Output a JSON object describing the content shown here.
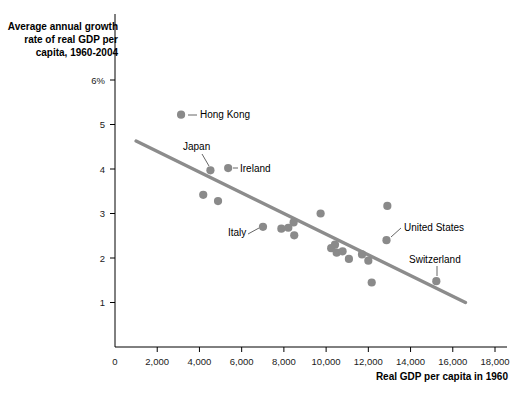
{
  "chart_data": {
    "type": "scatter",
    "title": "Average annual growth\nrate of real GDP per\ncapita, 1960-2004",
    "xlabel": "Real GDP per capita in 1960",
    "ylabel": "",
    "xlim": [
      0,
      18000
    ],
    "ylim": [
      0,
      6
    ],
    "grid": false,
    "legend": null,
    "x_ticks": [
      0,
      2000,
      4000,
      6000,
      8000,
      10000,
      12000,
      14000,
      16000,
      18000
    ],
    "x_tick_labels": [
      "0",
      "2,000",
      "4,000",
      "6,000",
      "8,000",
      "10,000",
      "12,000",
      "14,000",
      "16,000",
      "18,000"
    ],
    "y_ticks": [
      1,
      2,
      3,
      4,
      5,
      6
    ],
    "y_tick_labels": [
      "1",
      "2",
      "3",
      "4",
      "5",
      "6%"
    ],
    "point_color": "#8a8a8a",
    "trend_color": "#8c8c8c",
    "trendline": {
      "x0": 1000,
      "y0": 4.63,
      "x1": 16600,
      "y1": 1.0
    },
    "points": [
      {
        "x": 3130,
        "y": 5.22,
        "label": "Hong Kong"
      },
      {
        "x": 4520,
        "y": 3.97,
        "label": "Japan"
      },
      {
        "x": 5360,
        "y": 4.02,
        "label": "Ireland"
      },
      {
        "x": 4180,
        "y": 3.42,
        "label": null
      },
      {
        "x": 4880,
        "y": 3.28,
        "label": null
      },
      {
        "x": 7010,
        "y": 2.7,
        "label": "Italy"
      },
      {
        "x": 7880,
        "y": 2.66,
        "label": null
      },
      {
        "x": 8210,
        "y": 2.68,
        "label": null
      },
      {
        "x": 8460,
        "y": 2.8,
        "label": null
      },
      {
        "x": 8490,
        "y": 2.51,
        "label": null
      },
      {
        "x": 9740,
        "y": 3.0,
        "label": null
      },
      {
        "x": 10240,
        "y": 2.22,
        "label": null
      },
      {
        "x": 10420,
        "y": 2.3,
        "label": null
      },
      {
        "x": 10500,
        "y": 2.12,
        "label": null
      },
      {
        "x": 10780,
        "y": 2.15,
        "label": null
      },
      {
        "x": 11080,
        "y": 1.98,
        "label": null
      },
      {
        "x": 11700,
        "y": 2.08,
        "label": null
      },
      {
        "x": 12000,
        "y": 1.94,
        "label": null
      },
      {
        "x": 12900,
        "y": 3.17,
        "label": null
      },
      {
        "x": 12860,
        "y": 2.4,
        "label": "United States"
      },
      {
        "x": 12160,
        "y": 1.45,
        "label": null
      },
      {
        "x": 15220,
        "y": 1.48,
        "label": "Switzerland"
      }
    ],
    "annotations": [
      {
        "text": "Hong Kong",
        "tx": 200,
        "ty": 118,
        "lx0": 188,
        "ly0": 115,
        "lx1": 197,
        "ly1": 115
      },
      {
        "text": "Japan",
        "tx": 183,
        "ty": 150,
        "lx0": 202,
        "ly0": 154,
        "lx1": 209,
        "ly1": 166
      },
      {
        "text": "Ireland",
        "tx": 240,
        "ty": 172,
        "lx0": 233,
        "ly0": 168,
        "lx1": 238,
        "ly1": 168
      },
      {
        "text": "Italy",
        "tx": 228,
        "ty": 236,
        "lx0": 248,
        "ly0": 234,
        "lx1": 259,
        "ly1": 228
      },
      {
        "text": "United States",
        "tx": 404,
        "ty": 231,
        "lx0": 391,
        "ly0": 237,
        "lx1": 401,
        "ly1": 228
      },
      {
        "text": "Switzerland",
        "tx": 409,
        "ty": 263,
        "lx0": 437,
        "ly0": 276,
        "lx1": 437,
        "ly1": 266
      }
    ]
  }
}
